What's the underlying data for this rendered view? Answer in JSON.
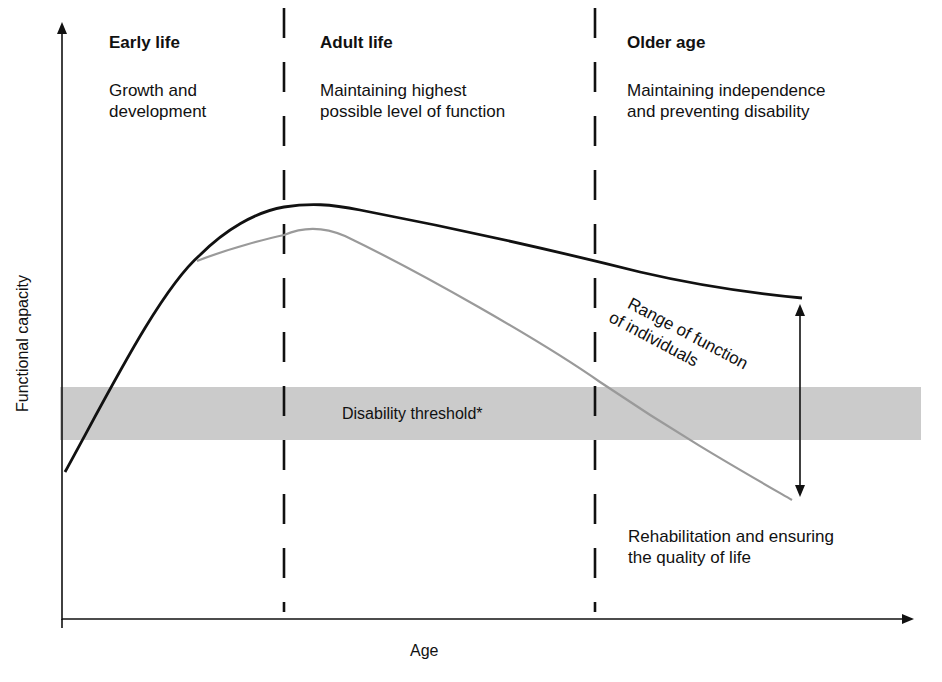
{
  "phases": [
    {
      "title": "Early life",
      "description_line1": "Growth and",
      "description_line2": "development"
    },
    {
      "title": "Adult life",
      "description_line1": "Maintaining highest",
      "description_line2": "possible level of function"
    },
    {
      "title": "Older age",
      "description_line1": "Maintaining independence",
      "description_line2": "and preventing disability"
    }
  ],
  "axes": {
    "y_label": "Functional capacity",
    "x_label": "Age"
  },
  "threshold": {
    "label": "Disability threshold*",
    "color": "#c8c8c8"
  },
  "range": {
    "label_line1": "Range of function",
    "label_line2": "of individuals"
  },
  "rehab": {
    "line1": "Rehabilitation and ensuring",
    "line2": "the quality of life"
  },
  "colors": {
    "upper_curve": "#111111",
    "lower_curve": "#9a9a9a",
    "axis": "#111111"
  }
}
